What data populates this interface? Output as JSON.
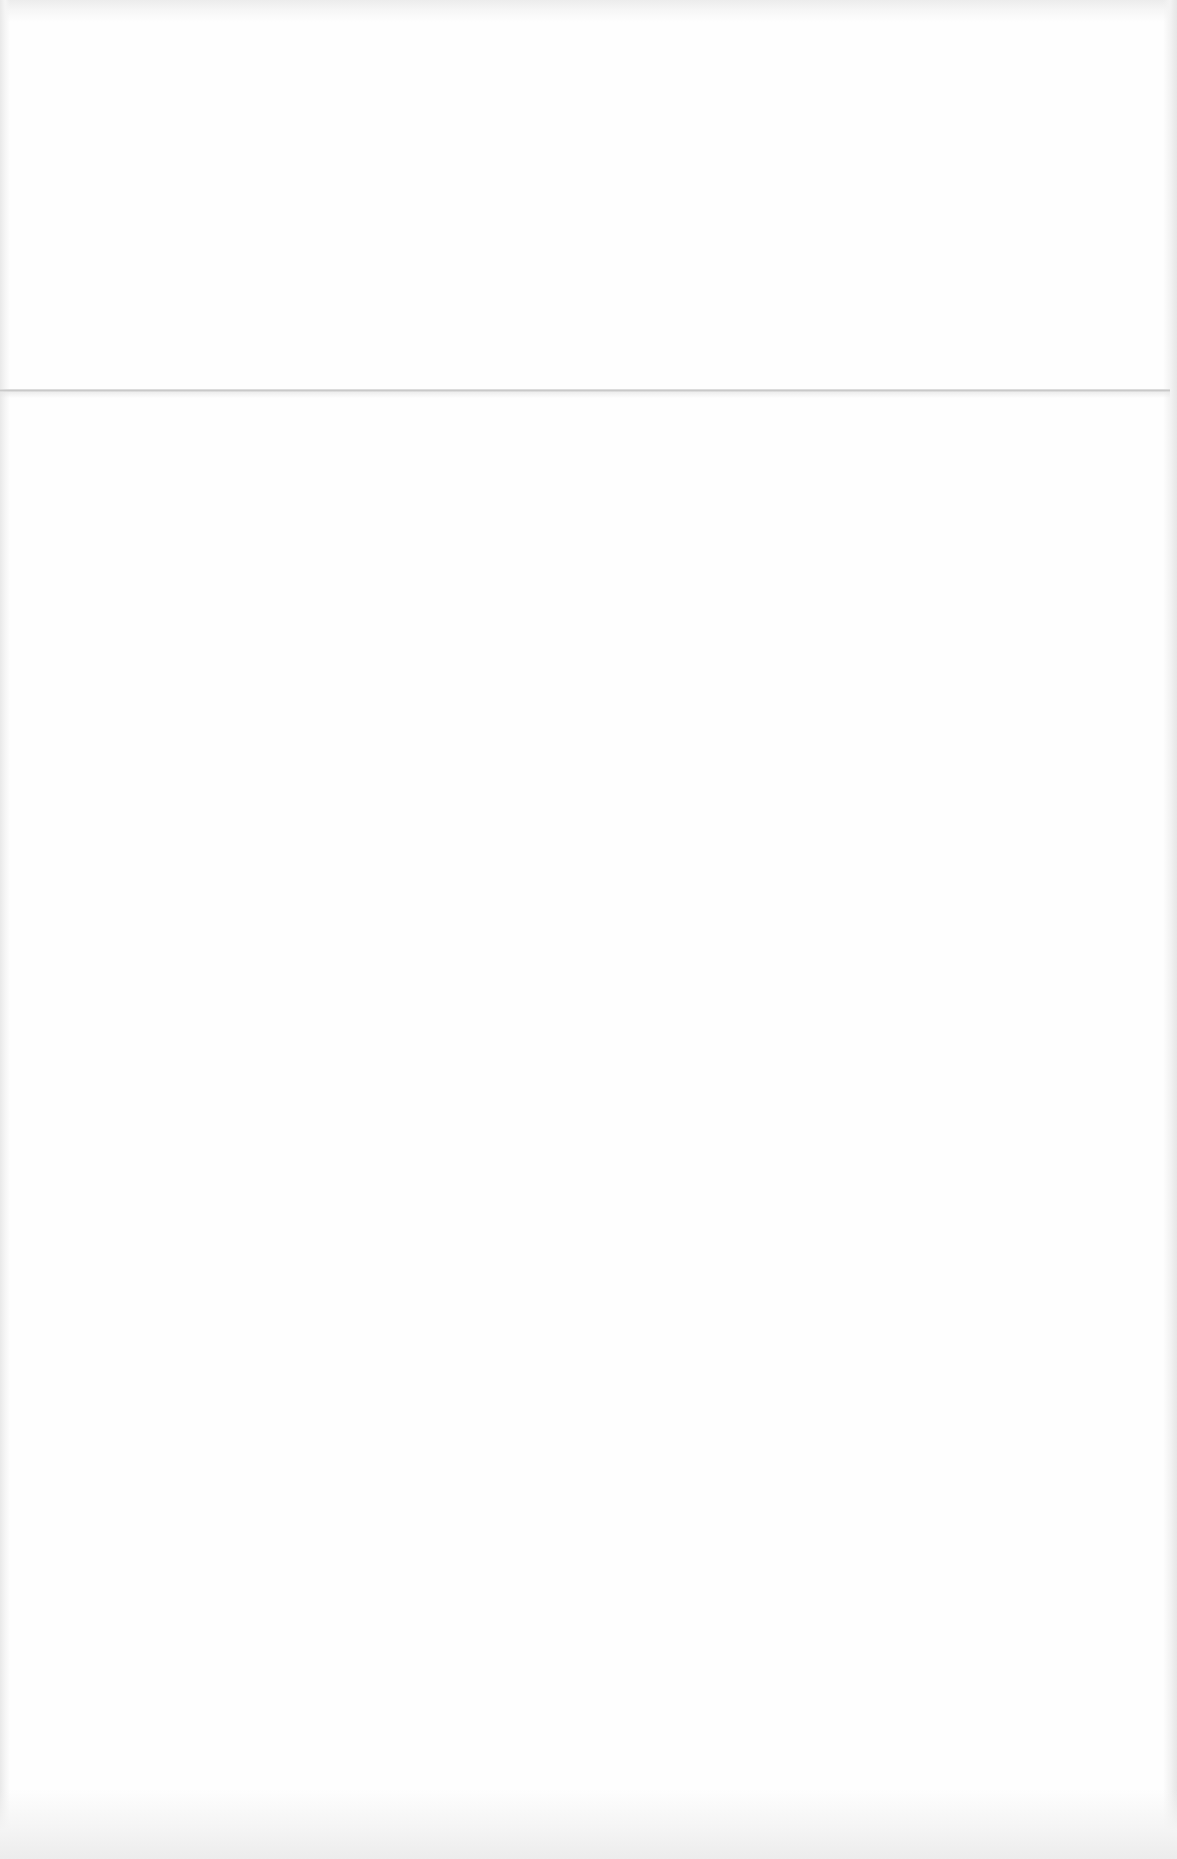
{
  "scene": {
    "description": "Blank sheet of white paper with a horizontal fold crease",
    "background_color": "#fefefe",
    "fold_line": {
      "color": "#c9c9c9"
    },
    "text_content": []
  }
}
